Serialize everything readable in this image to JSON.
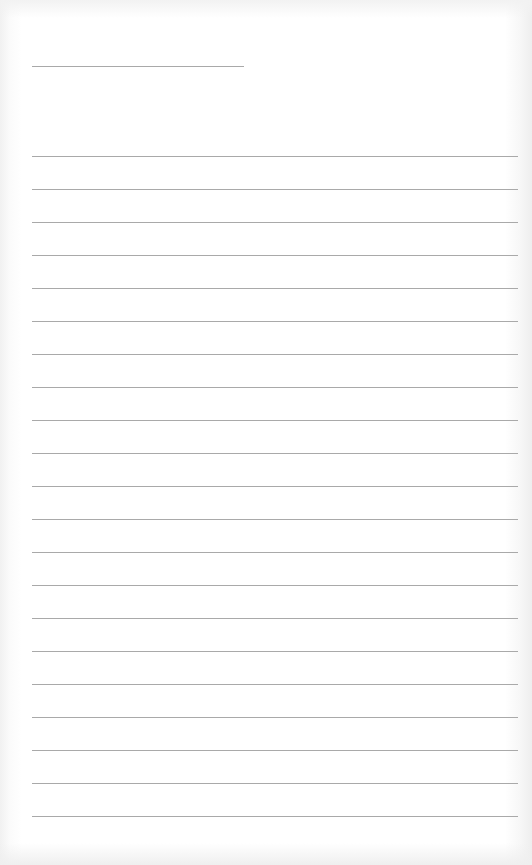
{
  "page": {
    "type": "lined-paper",
    "background_color": "#ffffff",
    "rule_color": "#a9a9a9",
    "title_rule": {
      "y": 66,
      "x_start": 32,
      "x_end": 244
    },
    "lines": {
      "count": 21,
      "first_y": 156,
      "spacing": 33,
      "x_start": 32
    }
  }
}
